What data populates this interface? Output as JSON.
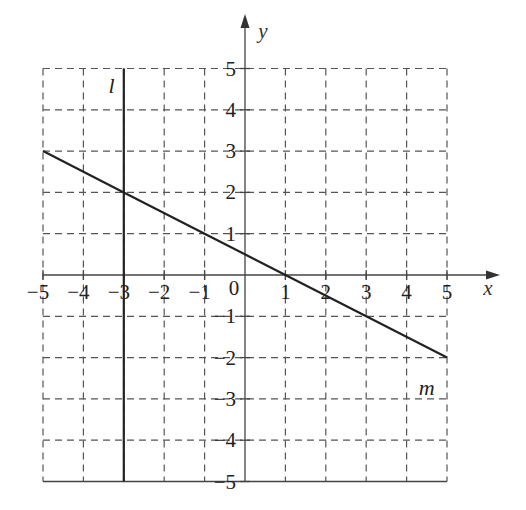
{
  "chart_data": {
    "type": "line",
    "title": "",
    "xlabel": "x",
    "ylabel": "y",
    "xlim": [
      -5,
      5
    ],
    "ylim": [
      -5,
      5
    ],
    "grid": true,
    "grid_style": "dashed",
    "x_ticks": [
      -5,
      -4,
      -3,
      -2,
      -1,
      1,
      2,
      3,
      4,
      5
    ],
    "y_ticks": [
      -5,
      -4,
      -3,
      -2,
      -1,
      1,
      2,
      3,
      4,
      5
    ],
    "x_tick_labels": [
      "−5",
      "−4",
      "−3",
      "−2",
      "−1",
      "1",
      "2",
      "3",
      "4",
      "5"
    ],
    "y_tick_labels": [
      "−5",
      "−4",
      "−3",
      "−2",
      "−1",
      "1",
      "2",
      "3",
      "4",
      "5"
    ],
    "origin_label": "0",
    "series": [
      {
        "name": "l",
        "kind": "vertical line",
        "equation": "x = -3",
        "points": [
          [
            -3,
            5
          ],
          [
            -3,
            -5
          ]
        ],
        "label_position": [
          -3.3,
          4.4
        ]
      },
      {
        "name": "m",
        "kind": "line segment",
        "equation": "y = -x/2 + 1/2",
        "points": [
          [
            -5,
            3
          ],
          [
            -3,
            2
          ],
          [
            -1,
            1
          ],
          [
            1,
            0
          ],
          [
            3,
            -1
          ],
          [
            5,
            -2
          ]
        ],
        "label_position": [
          4.5,
          -2.9
        ]
      }
    ],
    "intersection": [
      -3,
      2
    ]
  },
  "colors": {
    "background": "#ffffff",
    "grid": "#555555",
    "lines": "#222222"
  }
}
